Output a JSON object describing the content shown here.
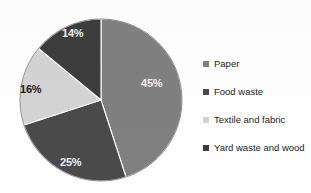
{
  "chart_data": {
    "type": "pie",
    "title": "",
    "subtitle": "",
    "xlabel": "",
    "ylabel": "",
    "legend_position": "right",
    "grid": false,
    "start_angle_deg": 0,
    "direction": "clockwise",
    "categories": [
      "Paper",
      "Food waste",
      "Textile and fabric",
      "Yard waste and wood"
    ],
    "values": [
      45,
      25,
      16,
      14
    ],
    "value_unit": "%",
    "data_labels": [
      "45%",
      "25%",
      "16%",
      "14%"
    ],
    "colors": [
      "#808080",
      "#4a4a4a",
      "#d4d4d4",
      "#3d3d3d"
    ],
    "slices": [
      {
        "label": "Paper",
        "value": 45,
        "data_label": "45%",
        "color": "#808080",
        "label_color": "on-dark",
        "label_x": 141,
        "label_y": 78
      },
      {
        "label": "Food waste",
        "value": 25,
        "data_label": "25%",
        "color": "#4a4a4a",
        "label_color": "on-dark",
        "label_x": 60,
        "label_y": 157
      },
      {
        "label": "Textile and fabric",
        "value": 16,
        "data_label": "16%",
        "color": "#d4d4d4",
        "label_color": "on-light",
        "label_x": 20,
        "label_y": 84
      },
      {
        "label": "Yard waste and wood",
        "value": 14,
        "data_label": "14%",
        "color": "#3d3d3d",
        "label_color": "on-dark",
        "label_x": 62,
        "label_y": 28
      }
    ]
  },
  "legend": {
    "items": [
      {
        "label": "Paper",
        "color": "#808080"
      },
      {
        "label": "Food waste",
        "color": "#4a4a4a"
      },
      {
        "label": "Textile and fabric",
        "color": "#d4d4d4"
      },
      {
        "label": "Yard waste and wood",
        "color": "#3d3d3d"
      }
    ]
  },
  "geometry": {
    "center_x": 101,
    "center_y": 100,
    "radius": 81
  }
}
